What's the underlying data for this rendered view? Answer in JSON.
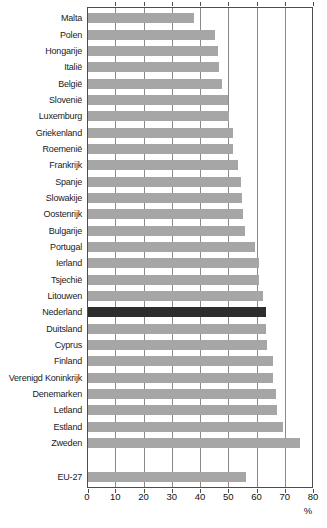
{
  "chart_data": {
    "type": "bar",
    "orientation": "horizontal",
    "title": "",
    "xlabel": "%",
    "unit": "%",
    "xlim": [
      0,
      80
    ],
    "xticks": [
      0,
      10,
      20,
      30,
      40,
      50,
      60,
      70,
      80
    ],
    "grid": "vertical",
    "categories": [
      "Malta",
      "Polen",
      "Hongarije",
      "Italië",
      "België",
      "Slovenië",
      "Luxemburg",
      "Griekenland",
      "Roemenië",
      "Frankrijk",
      "Spanje",
      "Slowakije",
      "Oostenrijk",
      "Bulgarije",
      "Portugal",
      "Ierland",
      "Tsjechië",
      "Litouwen",
      "Nederland",
      "Duitsland",
      "Cyprus",
      "Finland",
      "Verenigd Koninkrijk",
      "Denemarken",
      "Letland",
      "Estland",
      "Zweden"
    ],
    "values": [
      37.5,
      45,
      46,
      46.5,
      47.5,
      49.5,
      50,
      51.5,
      51.5,
      53,
      54,
      54.5,
      55,
      55.5,
      59,
      60.5,
      60.5,
      62,
      63,
      63,
      63.5,
      65.5,
      65.5,
      66.5,
      67,
      69,
      75
    ],
    "highlight_category": "Nederland",
    "summary_row": {
      "label": "EU-27",
      "value": 56
    },
    "colors": {
      "bar": "#a6a6a6",
      "highlight_bar": "#2e2e2e",
      "gridline": "#8a8a8a",
      "frame": "#4d4d4d",
      "text": "#1a1a1a"
    }
  }
}
